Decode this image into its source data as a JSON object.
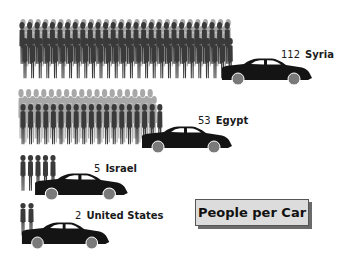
{
  "chart_data": {
    "type": "pictogram",
    "title": "People per Car",
    "categories": [
      "Syria",
      "Egypt",
      "Israel",
      "United States"
    ],
    "values": [
      112,
      53,
      5,
      2
    ],
    "unit": "people per car",
    "legend": null,
    "grid": false,
    "colors": {
      "person_front": "#3a3a3a",
      "person_back": "#a8a8a8",
      "car_body": "#141414",
      "car_window": "#ffffff",
      "wheel": "#7a7a7a",
      "title_box_bg": "#dcdcdc"
    }
  },
  "rows": [
    {
      "value": "112",
      "country": "Syria"
    },
    {
      "value": "53",
      "country": "Egypt"
    },
    {
      "value": "5",
      "country": "Israel"
    },
    {
      "value": "2",
      "country": "United States"
    }
  ],
  "title": "People per Car"
}
